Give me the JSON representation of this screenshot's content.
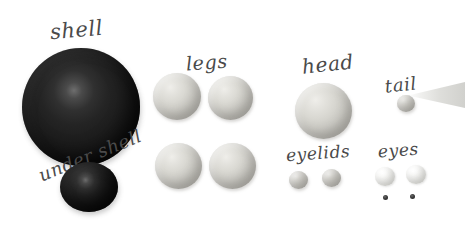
{
  "scene": {
    "title": "polymer clay turtle parts layout",
    "background_color": "#ffffff",
    "width": 465,
    "height": 232
  },
  "palette": {
    "clay_light": "#d9d8d2",
    "clay_white": "#f2f2f0",
    "clay_dark": "#1b1b1b",
    "label_ink": "#4a4a4a",
    "tail_gray": "#d6d6d2"
  },
  "labels": {
    "shell": "shell",
    "under_shell": "under shell",
    "legs": "legs",
    "head": "head",
    "tail": "tail",
    "eyelids": "eyelids",
    "eyes": "eyes"
  },
  "groups": [
    {
      "name": "shell",
      "label": "shell",
      "color": "#1b1b1b",
      "count": 1,
      "pieces": [
        {
          "x": 22,
          "y": 48,
          "d": 118
        }
      ]
    },
    {
      "name": "under-shell",
      "label": "under shell",
      "color": "#1b1b1b",
      "count": 1,
      "pieces": [
        {
          "x": 60,
          "y": 162,
          "d": 58
        }
      ]
    },
    {
      "name": "legs",
      "label": "legs",
      "color": "#d9d8d2",
      "count": 4,
      "pieces": [
        {
          "x": 153,
          "y": 73,
          "d": 48
        },
        {
          "x": 208,
          "y": 76,
          "d": 45
        },
        {
          "x": 155,
          "y": 143,
          "d": 47
        },
        {
          "x": 209,
          "y": 143,
          "d": 47
        }
      ]
    },
    {
      "name": "head",
      "label": "head",
      "color": "#d9d8d2",
      "count": 1,
      "pieces": [
        {
          "x": 295,
          "y": 83,
          "d": 57
        }
      ]
    },
    {
      "name": "tail",
      "label": "tail",
      "color": "#d6d6d2",
      "count": 1,
      "pieces": [
        {
          "x": 397,
          "y": 95,
          "d": 18
        }
      ]
    },
    {
      "name": "eyelids",
      "label": "eyelids",
      "color": "#d9d8d2",
      "count": 2,
      "pieces": [
        {
          "x": 289,
          "y": 171,
          "d": 19
        },
        {
          "x": 322,
          "y": 169,
          "d": 19
        }
      ]
    },
    {
      "name": "eyes",
      "label": "eyes",
      "color": "#f2f2f0",
      "count": 2,
      "pieces": [
        {
          "x": 375,
          "y": 167,
          "d": 20
        },
        {
          "x": 406,
          "y": 165,
          "d": 20
        }
      ]
    },
    {
      "name": "pupils",
      "label": "",
      "color": "#202020",
      "count": 2,
      "pieces": [
        {
          "x": 383,
          "y": 195,
          "d": 5
        },
        {
          "x": 410,
          "y": 194,
          "d": 5
        }
      ]
    }
  ]
}
